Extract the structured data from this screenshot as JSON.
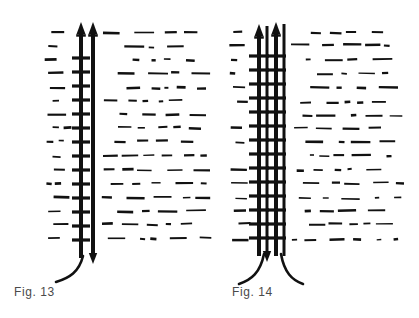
{
  "sheet": {
    "background_color": "#ffffff",
    "ink_color": "#111111",
    "caption_color": "#4a4a4a",
    "width": 419,
    "height": 318
  },
  "figures": [
    {
      "id": "fig13",
      "caption": "Fig. 13",
      "caption_x": 14,
      "caption_y": 285,
      "description": "single-tail twin-rod probe assembly",
      "rods": [
        {
          "name": "left-rod",
          "x": 81,
          "top": 22,
          "bottom": 258,
          "width": 4,
          "has_rungs": true,
          "tip": "arrowhead-up"
        },
        {
          "name": "right-rod",
          "x": 93,
          "top": 22,
          "bottom": 258,
          "width": 4,
          "has_rungs": false,
          "tip": "arrowhead-up"
        }
      ],
      "rung_count": 14,
      "rung_top": 58,
      "rung_spacing": 14,
      "rung_half_width": 9,
      "tails": [
        {
          "name": "tail-left",
          "start_x": 83,
          "start_y": 256,
          "end_x": 56,
          "end_y": 282
        }
      ],
      "hatch": {
        "x_start": 44,
        "x_end": 212,
        "y_start": 32,
        "y_end": 250,
        "row_spacing": 13.8,
        "rows": 16
      }
    },
    {
      "id": "fig14",
      "caption": "Fig. 14",
      "caption_x": 232,
      "caption_y": 285,
      "description": "double-tail four-rod probe assembly",
      "rods": [
        {
          "name": "outer-left-rod",
          "x": 259,
          "top": 24,
          "bottom": 256,
          "width": 4,
          "has_rungs": true,
          "tip": "arrowhead-up"
        },
        {
          "name": "inner-left-rod",
          "x": 267,
          "top": 26,
          "bottom": 256,
          "width": 3,
          "has_rungs": false,
          "tip": "none"
        },
        {
          "name": "inner-right-rod",
          "x": 276,
          "top": 22,
          "bottom": 256,
          "width": 4,
          "has_rungs": true,
          "tip": "arrowhead-up"
        },
        {
          "name": "outer-right-rod",
          "x": 284,
          "top": 24,
          "bottom": 256,
          "width": 3,
          "has_rungs": false,
          "tip": "none"
        }
      ],
      "rung_count": 14,
      "rung_top": 56,
      "rung_spacing": 14,
      "rung_half_width": 10,
      "tails": [
        {
          "name": "tail-left",
          "start_x": 264,
          "start_y": 254,
          "end_x": 239,
          "end_y": 284
        },
        {
          "name": "tail-right",
          "start_x": 281,
          "start_y": 254,
          "end_x": 303,
          "end_y": 284
        }
      ],
      "hatch": {
        "x_start": 229,
        "x_end": 408,
        "y_start": 32,
        "y_end": 250,
        "row_spacing": 13.8,
        "rows": 16
      }
    }
  ]
}
